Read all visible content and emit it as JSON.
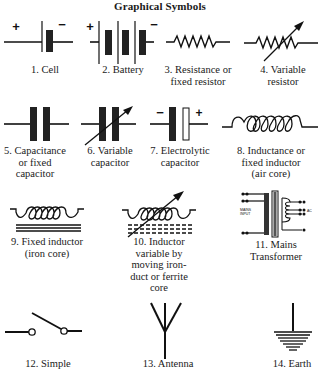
{
  "title": "Graphical Symbols",
  "symbols": [
    {
      "number": 1,
      "label": "1. Cell",
      "icon": "cell-symbol",
      "polarity": {
        "left": "+",
        "right": "−"
      }
    },
    {
      "number": 2,
      "label": "2. Battery",
      "icon": "battery-symbol",
      "polarity": {
        "left": "+",
        "right": "−"
      }
    },
    {
      "number": 3,
      "label_line1": "3. Resistance or",
      "label_line2": "fixed resistor",
      "icon": "resistor-symbol"
    },
    {
      "number": 4,
      "label_line1": "4. Variable",
      "label_line2": "resistor",
      "icon": "variable-resistor-symbol"
    },
    {
      "number": 5,
      "label_line1": "5. Capacitance",
      "label_line2": "or fixed",
      "label_line3": "capacitor",
      "icon": "capacitor-symbol"
    },
    {
      "number": 6,
      "label_line1": "6. Variable",
      "label_line2": "capacitor",
      "icon": "variable-capacitor-symbol"
    },
    {
      "number": 7,
      "label_line1": "7. Electrolytic",
      "label_line2": "capacitor",
      "icon": "electrolytic-capacitor-symbol",
      "polarity": {
        "left": "−",
        "right": "+"
      }
    },
    {
      "number": 8,
      "label_line1": "8. Inductance or",
      "label_line2": "fixed inductor",
      "label_line3": "(air core)",
      "icon": "air-core-inductor-symbol"
    },
    {
      "number": 9,
      "label_line1": "9. Fixed inductor",
      "label_line2": "(iron core)",
      "icon": "iron-core-inductor-symbol"
    },
    {
      "number": 10,
      "label_line1": "10. Inductor",
      "label_line2": "variable by",
      "label_line3": "moving iron-",
      "label_line4": "duct or ferrite",
      "label_line5": "core",
      "icon": "variable-inductor-symbol"
    },
    {
      "number": 11,
      "label_line1": "11. Mains",
      "label_line2": "Transformer",
      "icon": "mains-transformer-symbol",
      "inner_text": "MAINS INPUT"
    },
    {
      "number": 12,
      "label": "12. Simple",
      "icon": "simple-switch-symbol"
    },
    {
      "number": 13,
      "label": "13. Antenna",
      "icon": "antenna-symbol"
    },
    {
      "number": 14,
      "label": "14. Earth",
      "icon": "earth-symbol"
    }
  ]
}
